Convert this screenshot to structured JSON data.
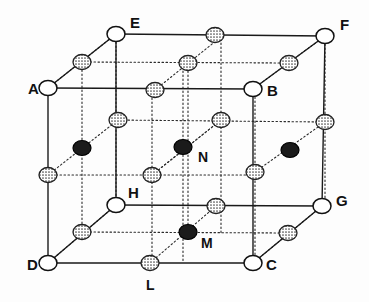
{
  "figure": {
    "width": 369,
    "height": 302,
    "background_color": "#fdfdfd"
  },
  "style": {
    "line_color": "#1a1a1a",
    "dotted_line_color": "#2b2b2b",
    "open_atom_fill": "#ffffff",
    "open_atom_stroke": "#111111",
    "shaded_atom_fill": "#b9b9b9",
    "shaded_atom_stroke": "#222222",
    "dark_atom_fill": "#1b1b1b",
    "dark_atom_stroke": "#000000",
    "label_color": "#111111"
  },
  "corners": [
    {
      "id": "A",
      "label": "A",
      "x": 48,
      "y": 88,
      "label_x": 28,
      "label_y": 94,
      "kind": "open"
    },
    {
      "id": "B",
      "label": "B",
      "x": 253,
      "y": 89,
      "label_x": 267,
      "label_y": 96,
      "kind": "open"
    },
    {
      "id": "C",
      "label": "C",
      "x": 253,
      "y": 263,
      "label_x": 266,
      "label_y": 270,
      "kind": "open"
    },
    {
      "id": "D",
      "label": "D",
      "x": 48,
      "y": 263,
      "label_x": 27,
      "label_y": 270,
      "kind": "open"
    },
    {
      "id": "E",
      "label": "E",
      "x": 116,
      "y": 34,
      "label_x": 130,
      "label_y": 28,
      "kind": "open"
    },
    {
      "id": "F",
      "label": "F",
      "x": 325,
      "y": 36,
      "label_x": 340,
      "label_y": 30,
      "kind": "open"
    },
    {
      "id": "G",
      "label": "G",
      "x": 322,
      "y": 206,
      "label_x": 336,
      "label_y": 206,
      "kind": "open"
    },
    {
      "id": "H",
      "label": "H",
      "x": 116,
      "y": 205,
      "label_x": 128,
      "label_y": 198,
      "kind": "open"
    }
  ],
  "labelled_interior_atoms": [
    {
      "id": "N",
      "label": "N",
      "x": 183,
      "y": 147,
      "label_x": 198,
      "label_y": 162,
      "kind": "dark"
    },
    {
      "id": "M",
      "label": "M",
      "x": 188,
      "y": 232,
      "label_x": 201,
      "label_y": 248,
      "kind": "dark"
    },
    {
      "id": "L",
      "label": "L",
      "x": 150,
      "y": 263,
      "label_x": 146,
      "label_y": 290,
      "kind": "shaded"
    }
  ],
  "shaded_atoms": [
    {
      "name": "edge-AE-midpoint",
      "x": 82,
      "y": 62
    },
    {
      "name": "edge-EF-midpoint",
      "x": 215,
      "y": 35
    },
    {
      "name": "edge-BF-midpoint",
      "x": 289,
      "y": 63
    },
    {
      "name": "edge-AB-midpoint",
      "x": 155,
      "y": 90
    },
    {
      "name": "top-face-centre",
      "x": 188,
      "y": 63
    },
    {
      "name": "face-ABFE-centre",
      "x": 118,
      "y": 120
    },
    {
      "name": "back-face-centre",
      "x": 221,
      "y": 120
    },
    {
      "name": "edge-FG-midpoint",
      "x": 325,
      "y": 122
    },
    {
      "name": "edge-AD-midpoint",
      "x": 48,
      "y": 175
    },
    {
      "name": "front-face-centre",
      "x": 152,
      "y": 175
    },
    {
      "name": "face-BCGF-centre",
      "x": 255,
      "y": 172
    },
    {
      "name": "edge-HG-midpoint",
      "x": 216,
      "y": 206
    },
    {
      "name": "edge-DH-midpoint",
      "x": 82,
      "y": 232
    },
    {
      "name": "edge-CG-midpoint",
      "x": 288,
      "y": 233
    }
  ],
  "dark_atoms": [
    {
      "name": "interior-left",
      "x": 82,
      "y": 148
    },
    {
      "name": "interior-right",
      "x": 290,
      "y": 150
    }
  ],
  "solid_edges": [
    {
      "name": "edge-A-B",
      "x1": 48,
      "y1": 88,
      "x2": 253,
      "y2": 89
    },
    {
      "name": "edge-B-C",
      "x1": 253,
      "y1": 89,
      "x2": 253,
      "y2": 263
    },
    {
      "name": "edge-C-D",
      "x1": 253,
      "y1": 263,
      "x2": 48,
      "y2": 263
    },
    {
      "name": "edge-D-A",
      "x1": 48,
      "y1": 263,
      "x2": 48,
      "y2": 88
    },
    {
      "name": "edge-E-F",
      "x1": 116,
      "y1": 34,
      "x2": 325,
      "y2": 36
    },
    {
      "name": "edge-F-G",
      "x1": 325,
      "y1": 36,
      "x2": 322,
      "y2": 206
    },
    {
      "name": "edge-G-H",
      "x1": 322,
      "y1": 206,
      "x2": 116,
      "y2": 205
    },
    {
      "name": "edge-H-E",
      "x1": 116,
      "y1": 205,
      "x2": 116,
      "y2": 34
    },
    {
      "name": "edge-A-E",
      "x1": 48,
      "y1": 88,
      "x2": 116,
      "y2": 34
    },
    {
      "name": "edge-B-F",
      "x1": 253,
      "y1": 89,
      "x2": 325,
      "y2": 36
    },
    {
      "name": "edge-C-G",
      "x1": 253,
      "y1": 263,
      "x2": 322,
      "y2": 206
    },
    {
      "name": "edge-D-H",
      "x1": 48,
      "y1": 263,
      "x2": 116,
      "y2": 205
    }
  ],
  "dotted_lines": [
    {
      "name": "dotted-A-E-extension",
      "x1": 48,
      "y1": 88,
      "x2": 116,
      "y2": 34
    },
    {
      "name": "dotted-AE-mid-to-EF",
      "x1": 82,
      "y1": 62,
      "x2": 289,
      "y2": 63
    },
    {
      "name": "dotted-back-horiz-mid",
      "x1": 116,
      "y1": 120,
      "x2": 325,
      "y2": 122
    },
    {
      "name": "dotted-front-horiz",
      "x1": 48,
      "y1": 175,
      "x2": 255,
      "y2": 175
    },
    {
      "name": "dotted-bottom-inner",
      "x1": 82,
      "y1": 232,
      "x2": 288,
      "y2": 233
    },
    {
      "name": "dotted-diag-left-low",
      "x1": 48,
      "y1": 175,
      "x2": 118,
      "y2": 120
    },
    {
      "name": "dotted-diag-D-H-inner",
      "x1": 48,
      "y1": 263,
      "x2": 116,
      "y2": 205
    },
    {
      "name": "dotted-diag-L-M",
      "x1": 150,
      "y1": 263,
      "x2": 216,
      "y2": 206
    },
    {
      "name": "dotted-diag-C-G-inner",
      "x1": 253,
      "y1": 263,
      "x2": 322,
      "y2": 206
    },
    {
      "name": "dotted-diag-front-mid",
      "x1": 152,
      "y1": 175,
      "x2": 221,
      "y2": 120
    },
    {
      "name": "dotted-diag-centre-N",
      "x1": 152,
      "y1": 175,
      "x2": 221,
      "y2": 120
    },
    {
      "name": "dotted-diag-right-mid",
      "x1": 255,
      "y1": 172,
      "x2": 325,
      "y2": 122
    },
    {
      "name": "dotted-diag-B-F-inner",
      "x1": 253,
      "y1": 89,
      "x2": 325,
      "y2": 36
    },
    {
      "name": "dotted-diag-AB-top",
      "x1": 155,
      "y1": 90,
      "x2": 222,
      "y2": 36
    },
    {
      "name": "dotted-vert-left",
      "x1": 116,
      "y1": 34,
      "x2": 116,
      "y2": 205
    },
    {
      "name": "dotted-vert-mid",
      "x1": 183,
      "y1": 63,
      "x2": 183,
      "y2": 263
    },
    {
      "name": "dotted-vert-back",
      "x1": 221,
      "y1": 35,
      "x2": 221,
      "y2": 233
    },
    {
      "name": "dotted-vert-far",
      "x1": 325,
      "y1": 36,
      "x2": 325,
      "y2": 206
    },
    {
      "name": "dotted-vert-leftedge",
      "x1": 82,
      "y1": 62,
      "x2": 82,
      "y2": 232
    },
    {
      "name": "dotted-vert-centre",
      "x1": 152,
      "y1": 90,
      "x2": 152,
      "y2": 263
    },
    {
      "name": "dotted-vert-rightmid",
      "x1": 255,
      "y1": 89,
      "x2": 255,
      "y2": 263
    },
    {
      "name": "dotted-vert-N",
      "x1": 188,
      "y1": 63,
      "x2": 188,
      "y2": 232
    }
  ],
  "geometry": {
    "atom_radius_open": 9,
    "atom_radius_shaded": 9,
    "atom_radius_dark": 9,
    "line_width": 1.4,
    "dotted_dash": "1.5 2.5"
  }
}
